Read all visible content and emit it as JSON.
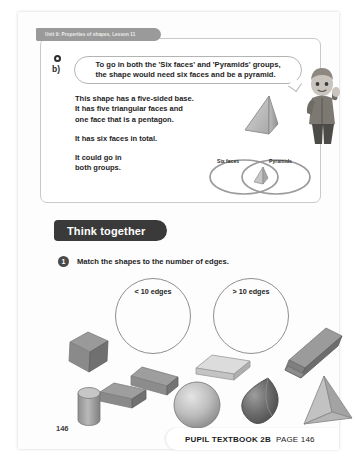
{
  "page": {
    "unit_tab": "Unit 9: Properties of shapes, Lesson 11",
    "page_number": "146"
  },
  "activity": {
    "part_label": "b)",
    "speech_bubble": "To go in both the 'Six faces' and 'Pyramids' groups,\nthe shape would need six faces and be a pyramid.",
    "explanation": [
      "This shape has a five-sided base.\nIt has five triangular faces and\none face that is a pentagon.",
      "It has six faces in total.",
      "It could go in\nboth groups."
    ],
    "venn": {
      "left_label": "Six faces",
      "right_label": "Pyramids",
      "intersection_shape": "pentagon-pyramid"
    },
    "illustration_shape": "pentagon-pyramid",
    "character": "boy-pupil"
  },
  "think_together": {
    "banner": "Think together",
    "question_number": "1",
    "question_text": "Match the shapes to the number of edges.",
    "sort_circles": [
      {
        "label": "< 10 edges"
      },
      {
        "label": "> 10 edges"
      }
    ],
    "shapes": [
      {
        "name": "cube"
      },
      {
        "name": "cuboid-small"
      },
      {
        "name": "cuboid-flat"
      },
      {
        "name": "hexagonal-prism"
      },
      {
        "name": "cuboid-tall"
      },
      {
        "name": "cylinder"
      },
      {
        "name": "sphere"
      },
      {
        "name": "cone"
      },
      {
        "name": "tetrahedron"
      }
    ]
  },
  "footer": {
    "book": "PUPIL TEXTBOOK 2B",
    "page": "PAGE 146"
  }
}
